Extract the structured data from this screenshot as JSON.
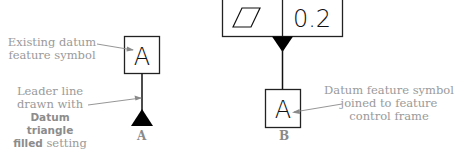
{
  "diagram": {
    "panel_a": {
      "caption": "A",
      "datum_letter": "A",
      "note_top": {
        "line1": "Existing datum",
        "line2": "feature symbol"
      },
      "note_bottom": {
        "line1": "Leader line",
        "line2": "drawn with",
        "bold1": "Datum triangle",
        "bold2": "filled",
        "tail": " setting"
      }
    },
    "panel_b": {
      "caption": "B",
      "datum_letter": "A",
      "fcf_tolerance": "0.2",
      "fcf_symbol": "flatness-parallelogram",
      "note": {
        "line1": "Datum feature symbol",
        "line2": "joined to feature",
        "line3": "control frame"
      }
    },
    "colors": {
      "line": "#111111",
      "annotation": "#9a9a9a",
      "leader": "#8a8a8a"
    }
  }
}
